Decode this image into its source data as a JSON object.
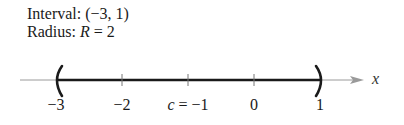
{
  "caption": {
    "interval_label": "Interval:",
    "interval_value": "(−3, 1)",
    "radius_label": "Radius:",
    "radius_var": "R",
    "radius_eq": "= 2"
  },
  "number_line": {
    "axis_variable": "x",
    "interval_open_left": "(",
    "interval_open_right": ")",
    "ticks": [
      {
        "value": -3,
        "label": "−3"
      },
      {
        "value": -2,
        "label": "−2"
      },
      {
        "value": -1,
        "label_var": "c",
        "label": "= −1"
      },
      {
        "value": 0,
        "label": "0"
      },
      {
        "value": 1,
        "label": "1"
      }
    ],
    "center": {
      "var": "c",
      "value": -1
    },
    "interval": [
      -3,
      1
    ],
    "colors": {
      "axis": "#999999",
      "interval": "#1a1a1a",
      "text": "#1a1a1a"
    }
  }
}
